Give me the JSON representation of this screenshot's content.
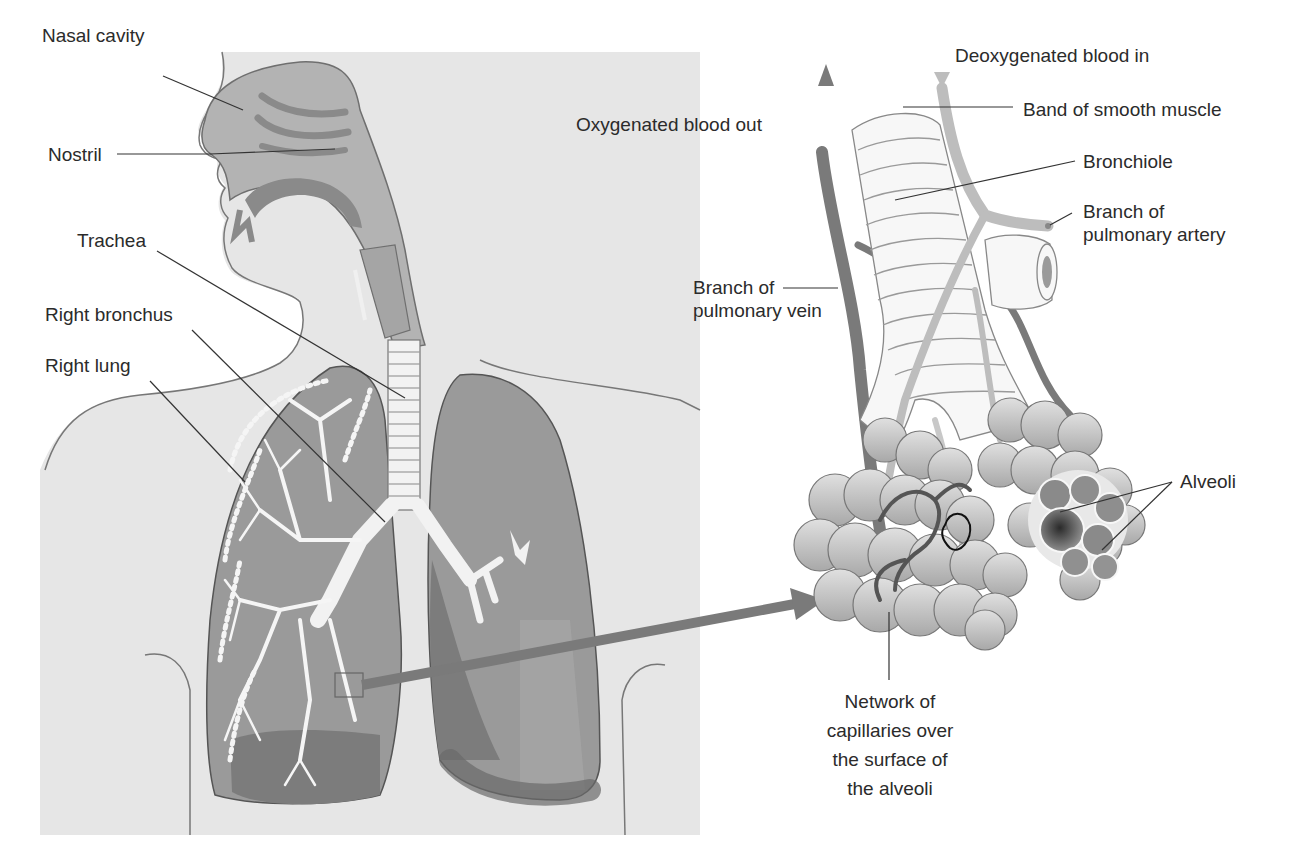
{
  "diagram": {
    "colors": {
      "background": "#ffffff",
      "body_fill": "#e6e6e6",
      "body_outline": "#777777",
      "nasal_fill": "#b3b3b3",
      "nasal_dark": "#8a8a8a",
      "lung_fill": "#9a9a9a",
      "lung_dark": "#7c7c7c",
      "trachea_fill": "#f2f2f2",
      "vein": "#7a7a7a",
      "artery": "#bdbdbd",
      "alveoli_fill": "#b5b5b5",
      "leader_line": "#333333",
      "label_text": "#2b2b2b"
    },
    "left_panel": {
      "labels": [
        {
          "id": "nasal-cavity",
          "text": "Nasal cavity"
        },
        {
          "id": "nostril",
          "text": "Nostril"
        },
        {
          "id": "trachea",
          "text": "Trachea"
        },
        {
          "id": "right-bronchus",
          "text": "Right bronchus"
        },
        {
          "id": "right-lung",
          "text": "Right lung"
        }
      ]
    },
    "right_panel": {
      "labels": [
        {
          "id": "deoxygenated-blood-in",
          "text": "Deoxygenated blood in"
        },
        {
          "id": "oxygenated-blood-out",
          "text": "Oxygenated blood out"
        },
        {
          "id": "band-of-smooth-muscle",
          "text": "Band of smooth muscle"
        },
        {
          "id": "bronchiole",
          "text": "Bronchiole"
        },
        {
          "id": "branch-of-pulmonary-artery",
          "lines": [
            "Branch of",
            "pulmonary artery"
          ]
        },
        {
          "id": "branch-of-pulmonary-vein",
          "lines": [
            "Branch of",
            "pulmonary vein"
          ]
        },
        {
          "id": "alveoli",
          "text": "Alveoli"
        },
        {
          "id": "capillary-network",
          "lines": [
            "Network of",
            "capillaries over",
            "the surface of",
            "the alveoli"
          ]
        }
      ]
    }
  }
}
